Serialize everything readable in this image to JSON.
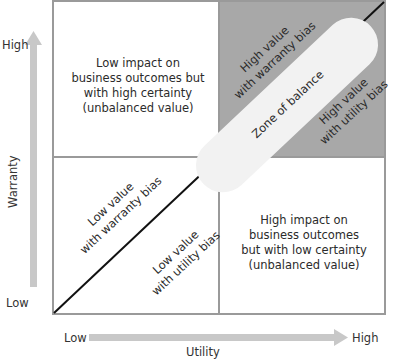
{
  "axes": {
    "y": {
      "title": "Warranty",
      "high": "High",
      "low": "Low"
    },
    "x": {
      "title": "Utility",
      "high": "High",
      "low": "Low"
    }
  },
  "quadrants": {
    "top_left": [
      "Low impact on",
      "business outcomes but",
      "with high certainty",
      "(unbalanced value)"
    ],
    "top_right_upper": [
      "High value",
      "with warranty bias"
    ],
    "top_right_lower": [
      "High value",
      "with utility bias"
    ],
    "bottom_left_upper": [
      "Low value",
      "with warranty bias"
    ],
    "bottom_left_lower": [
      "Low value",
      "with utility bias"
    ],
    "bottom_right": [
      "High impact on",
      "business outcomes",
      "but with low certainty",
      "(unbalanced value)"
    ]
  },
  "zone": {
    "label": "Zone of balance"
  },
  "colors": {
    "border": "#9a9a9a",
    "shaded_quadrant": "#a8a8a8",
    "zone_fill": "#f2f2f2",
    "arrow": "#c8c8c8",
    "diagonal": "#111111"
  }
}
